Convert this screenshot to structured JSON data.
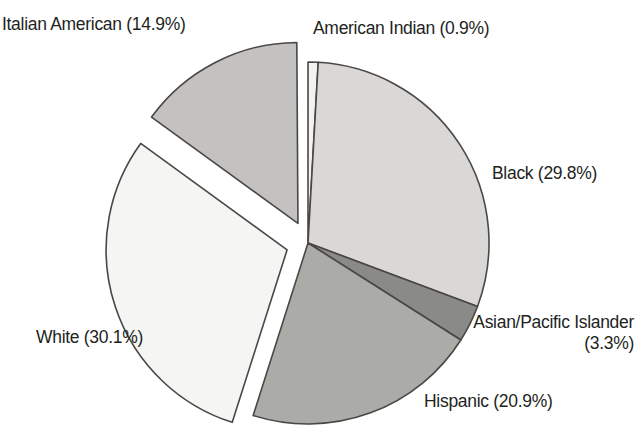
{
  "chart_data": {
    "type": "pie",
    "title": "",
    "subtitle": "",
    "xlabel": "",
    "ylabel": "",
    "legend_position": "none",
    "grid": false,
    "units": "percent",
    "start_angle_deg": 0,
    "direction": "clockwise",
    "categories": [
      "American Indian",
      "Black",
      "Asian/Pacific Islander",
      "Hispanic",
      "White",
      "Italian American"
    ],
    "values": [
      0.9,
      29.8,
      3.3,
      20.9,
      30.1,
      14.9
    ],
    "slices": [
      {
        "label": "American Indian",
        "value": 0.9,
        "label_text": "American Indian (0.9%)",
        "color": "#f2f2f0",
        "exploded": false,
        "start_deg": 0.0,
        "end_deg": 3.24
      },
      {
        "label": "Black",
        "value": 29.8,
        "label_text": "Black (29.8%)",
        "color": "#d9d8d6",
        "exploded": false,
        "start_deg": 3.24,
        "end_deg": 110.52
      },
      {
        "label": "Asian/Pacific Islander",
        "value": 3.3,
        "label_text_line1": "Asian/Pacific Islander",
        "label_text_line2": "(3.3%)",
        "label_text": "Asian/Pacific Islander (3.3%)",
        "color": "#8a8a88",
        "exploded": false,
        "start_deg": 110.52,
        "end_deg": 122.4
      },
      {
        "label": "Hispanic",
        "value": 20.9,
        "label_text": "Hispanic (20.9%)",
        "color": "#ababa8",
        "exploded": false,
        "start_deg": 122.4,
        "end_deg": 197.64
      },
      {
        "label": "White",
        "value": 30.1,
        "label_text": "White (30.1%)",
        "color": "#f5f5f3",
        "exploded": true,
        "start_deg": 197.64,
        "end_deg": 306.0
      },
      {
        "label": "Italian American",
        "value": 14.9,
        "label_text": "Italian American (14.9%)",
        "color": "#c3c2c0",
        "exploded": true,
        "start_deg": 306.0,
        "end_deg": 359.64
      }
    ],
    "geometry": {
      "center_x": 308,
      "center_y": 243,
      "radius": 181,
      "explode_offset": 22,
      "stroke_color": "#4a4745",
      "stroke_width": 1.6
    }
  },
  "labels": {
    "italian_american": "Italian American (14.9%)",
    "american_indian": "American Indian (0.9%)",
    "black": "Black (29.8%)",
    "asian_pacific_islander_line1": "Asian/Pacific Islander",
    "asian_pacific_islander_line2": "(3.3%)",
    "hispanic": "Hispanic (20.9%)",
    "white": "White (30.1%)"
  }
}
